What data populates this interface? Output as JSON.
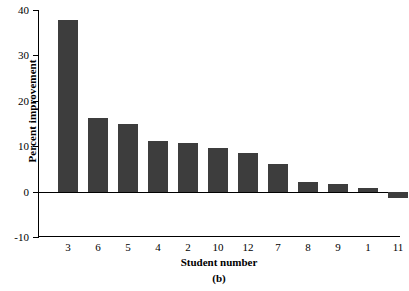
{
  "chart_data": {
    "type": "bar",
    "title": "",
    "subtitle": "",
    "panel_caption": "(b)",
    "xlabel": "Student number",
    "ylabel": "Percent improvement",
    "categories": [
      "3",
      "6",
      "5",
      "4",
      "2",
      "10",
      "12",
      "7",
      "8",
      "9",
      "1",
      "11"
    ],
    "values": [
      37.7,
      16.2,
      15.0,
      11.2,
      10.6,
      9.7,
      8.6,
      6.0,
      2.2,
      1.6,
      0.7,
      -1.5
    ],
    "series": [
      {
        "name": "Percent improvement",
        "values": [
          37.7,
          16.2,
          15.0,
          11.2,
          10.6,
          9.7,
          8.6,
          6.0,
          2.2,
          1.6,
          0.7,
          -1.5
        ]
      }
    ],
    "ylim": [
      -10,
      40
    ],
    "yticks": [
      -10,
      0,
      10,
      20,
      30,
      40
    ],
    "ytick_labels": [
      "-10",
      "0",
      "10",
      "20",
      "30",
      "40"
    ],
    "grid": false,
    "legend": false,
    "legend_position": "none",
    "bar_color": "#3d3d3d",
    "axis_color": "#000000",
    "background_color": "#ffffff",
    "zero_baseline": 0
  }
}
